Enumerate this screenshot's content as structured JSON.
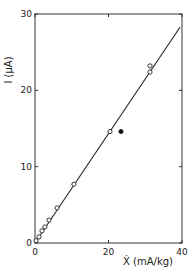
{
  "chart_data": {
    "type": "scatter",
    "title": "",
    "xlabel": "Ẋ (mA/kg)",
    "ylabel": "I (µA)",
    "xlim": [
      0,
      40
    ],
    "ylim": [
      0,
      30
    ],
    "x_ticks": [
      0,
      20,
      40
    ],
    "x_tick_labels": [
      "0",
      "20",
      "40"
    ],
    "y_ticks": [
      0,
      10,
      20,
      30
    ],
    "y_tick_labels": [
      "0",
      "10",
      "20",
      "30"
    ],
    "grid": false,
    "legend": null,
    "series": [
      {
        "name": "open circles (data)",
        "marker": "open-circle",
        "points": [
          {
            "x": 0.3,
            "y": 0.3
          },
          {
            "x": 1.1,
            "y": 0.8
          },
          {
            "x": 1.9,
            "y": 1.6
          },
          {
            "x": 2.7,
            "y": 2.1
          },
          {
            "x": 3.8,
            "y": 3.0
          },
          {
            "x": 6.0,
            "y": 4.6
          },
          {
            "x": 10.6,
            "y": 7.7
          },
          {
            "x": 20.4,
            "y": 14.6
          },
          {
            "x": 31.3,
            "y": 22.4
          },
          {
            "x": 31.3,
            "y": 23.2
          }
        ]
      },
      {
        "name": "filled circle (outlier)",
        "marker": "filled-circle",
        "points": [
          {
            "x": 23.4,
            "y": 14.6
          }
        ]
      },
      {
        "name": "fit line",
        "marker": "line",
        "points": [
          {
            "x": 0,
            "y": 0
          },
          {
            "x": 39.5,
            "y": 28.3
          }
        ]
      }
    ]
  },
  "axes": {
    "x_label": "Ẋ (mA/kg)",
    "y_label": "I (µA)",
    "x_ticks": [
      "0",
      "20",
      "40"
    ],
    "y_ticks": [
      "0",
      "10",
      "20",
      "30"
    ]
  },
  "colors": {
    "ink": "#222222",
    "background": "#ffffff"
  }
}
